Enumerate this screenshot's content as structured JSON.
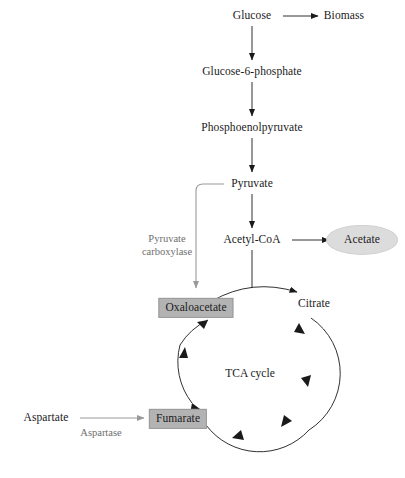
{
  "figure": {
    "background_color": "#ffffff",
    "arrow_color_primary": "#1a1a1a",
    "arrow_color_secondary": "#9a9a9a",
    "highlight_box_color": "#b3b3b3",
    "highlight_ellipse_color": "#dcdcdc",
    "enzyme_text_color": "#6e6e6e"
  },
  "nodes": {
    "glucose": {
      "label": "Glucose",
      "style": "plain",
      "x": 252,
      "y": 16
    },
    "biomass": {
      "label": "Biomass",
      "style": "plain",
      "x": 344,
      "y": 16
    },
    "glucose6phosphate": {
      "label": "Glucose-6-phosphate",
      "style": "plain",
      "x": 252,
      "y": 72
    },
    "phosphoenolpyruvate": {
      "label": "Phosphoenolpyruvate",
      "style": "plain",
      "x": 252,
      "y": 128
    },
    "pyruvate": {
      "label": "Pyruvate",
      "style": "plain",
      "x": 252,
      "y": 184
    },
    "acetylcoa": {
      "label": "Acetyl-CoA",
      "style": "plain",
      "x": 252,
      "y": 240
    },
    "acetate": {
      "label": "Acetate",
      "style": "ellipse",
      "x": 362,
      "y": 240
    },
    "oxaloacetate": {
      "label": "Oxaloacetate",
      "style": "boxed",
      "x": 196,
      "y": 308
    },
    "citrate": {
      "label": "Citrate",
      "style": "plain",
      "x": 314,
      "y": 304
    },
    "fumarate": {
      "label": "Fumarate",
      "style": "boxed",
      "x": 178,
      "y": 419
    },
    "aspartate": {
      "label": "Aspartate",
      "style": "plain",
      "x": 46,
      "y": 418
    }
  },
  "enzyme_labels": {
    "pyruvate_carboxylase": {
      "text": "Pyruvate\ncarboxylase",
      "x": 167,
      "y": 246
    },
    "aspartase": {
      "text": "Aspartase",
      "x": 101,
      "y": 433
    }
  },
  "cycle": {
    "label": "TCA cycle",
    "label_x": 250,
    "label_y": 373,
    "center_x": 245,
    "center_y": 373,
    "radius": 67
  },
  "edges": [
    {
      "name": "glucose-to-biomass",
      "from": "glucose",
      "to": "biomass",
      "color": "primary"
    },
    {
      "name": "glucose-to-g6p",
      "from": "glucose",
      "to": "glucose6phosphate",
      "color": "primary"
    },
    {
      "name": "g6p-to-pep",
      "from": "glucose6phosphate",
      "to": "phosphoenolpyruvate",
      "color": "primary"
    },
    {
      "name": "pep-to-pyruvate",
      "from": "phosphoenolpyruvate",
      "to": "pyruvate",
      "color": "primary"
    },
    {
      "name": "pyruvate-to-acetylcoa",
      "from": "pyruvate",
      "to": "acetylcoa",
      "color": "primary"
    },
    {
      "name": "acetylcoa-to-acetate",
      "from": "acetylcoa",
      "to": "acetate",
      "color": "primary"
    },
    {
      "name": "pyruvate-to-oxaloacetate",
      "from": "pyruvate",
      "to": "oxaloacetate",
      "color": "secondary"
    },
    {
      "name": "oxaloacetate-to-citrate",
      "from": "oxaloacetate",
      "to": "citrate",
      "color": "primary"
    },
    {
      "name": "aspartate-to-fumarate",
      "from": "aspartate",
      "to": "fumarate",
      "color": "secondary"
    }
  ]
}
